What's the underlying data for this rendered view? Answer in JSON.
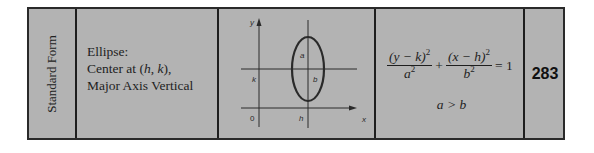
{
  "table": {
    "row_label": "Standard Form",
    "description": {
      "line1": "Ellipse:",
      "line2_prefix": "Center at (",
      "line2_h": "h",
      "line2_sep": ", ",
      "line2_k": "k",
      "line2_suffix": "),",
      "line3": "Major Axis Vertical"
    },
    "diagram": {
      "y_axis_label": "y",
      "x_axis_label": "x",
      "origin_label": "0",
      "k_label": "k",
      "h_label": "h",
      "a_label": "a",
      "b_label": "b"
    },
    "formula": {
      "term1_num": "(y − k)",
      "term1_num_exp": "2",
      "term1_den": "a",
      "term1_den_exp": "2",
      "plus": "+",
      "term2_num": "(x − h)",
      "term2_num_exp": "2",
      "term2_den": "b",
      "term2_den_exp": "2",
      "equals": "= 1",
      "condition": "a > b"
    },
    "page_number": "283"
  },
  "colors": {
    "cell_background": "#b3b3b3",
    "border": "#1e1e1e",
    "text": "#1e1e1e"
  }
}
